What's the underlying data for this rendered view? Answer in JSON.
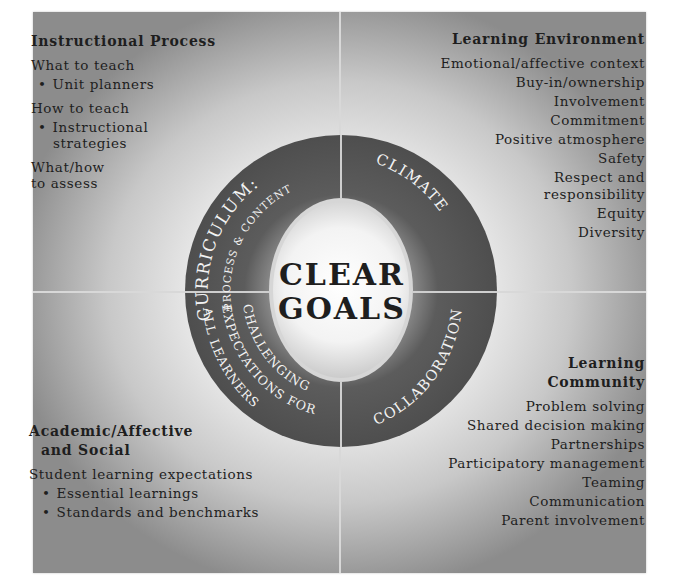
{
  "center": {
    "line1": "CLEAR",
    "line2": "GOALS"
  },
  "ring": {
    "top_left": {
      "main": "CURRICULUM:",
      "sub": "PROCESS & CONTENT"
    },
    "top_right": {
      "main": "CLIMATE"
    },
    "bottom_right": {
      "main": "COLLABORATION"
    },
    "bottom_left": {
      "line1": "CHALLENGING",
      "line2": "EXPECTATIONS FOR",
      "line3": "ALL LEARNERS"
    }
  },
  "quadrants": {
    "top_left": {
      "title": "Instructional Process",
      "items": [
        {
          "text": "What to teach",
          "bullet": false
        },
        {
          "text": "Unit planners",
          "bullet": true
        },
        {
          "text": "How to teach",
          "bullet": false
        },
        {
          "text": "Instructional",
          "bullet": true
        },
        {
          "text": "strategies",
          "bullet": false,
          "indent": true
        },
        {
          "text": "What/how",
          "bullet": false
        },
        {
          "text": "to assess",
          "bullet": false
        }
      ]
    },
    "top_right": {
      "title": "Learning Environment",
      "items": [
        "Emotional/affective context",
        "Buy-in/ownership",
        "Involvement",
        "Commitment",
        "Positive atmosphere",
        "Safety",
        "Respect and",
        "responsibility",
        "Equity",
        "Diversity"
      ]
    },
    "bottom_left": {
      "title_line1": "Academic/Affective",
      "title_line2": "and Social",
      "items": [
        {
          "text": "Student learning expectations",
          "bullet": false
        },
        {
          "text": "Essential learnings",
          "bullet": true
        },
        {
          "text": "Standards and benchmarks",
          "bullet": true
        }
      ]
    },
    "bottom_right": {
      "title_line1": "Learning",
      "title_line2": "Community",
      "items": [
        "Problem solving",
        "Shared decision making",
        "Partnerships",
        "Participatory management",
        "Teaming",
        "Communication",
        "Parent involvement"
      ]
    }
  },
  "colors": {
    "ring": "#555555",
    "ring_text": "#f2f2f2",
    "center_text": "#1e1e1e",
    "divider": "#d8d8d8"
  }
}
